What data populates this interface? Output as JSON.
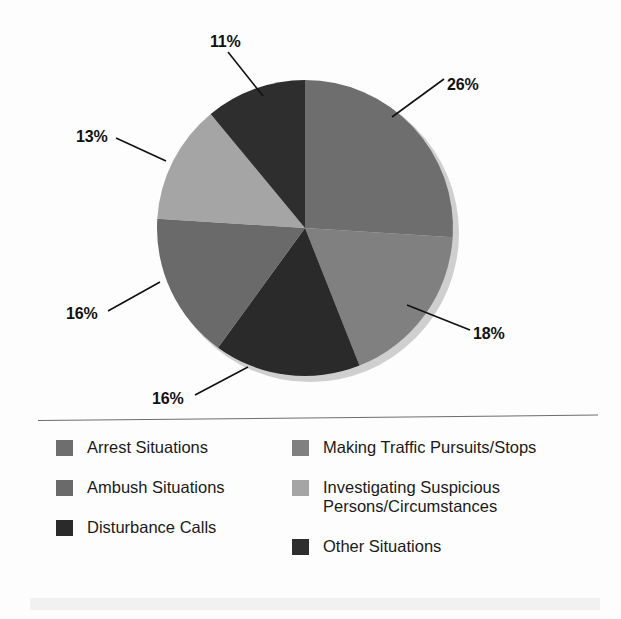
{
  "chart_data": {
    "type": "pie",
    "title": "",
    "subtitle": "",
    "xlabel": "",
    "ylabel": "",
    "grid": false,
    "legend_position": "bottom",
    "units": "percent",
    "start_angle_deg": 0,
    "direction": "clockwise",
    "categories": [
      "Arrest Situations",
      "Making Traffic Pursuits/Stops",
      "Disturbance Calls",
      "Ambush Situations",
      "Investigating Suspicious Persons/Circumstances",
      "Other Situations"
    ],
    "values": [
      26,
      18,
      16,
      16,
      13,
      11
    ],
    "data_labels": [
      "26%",
      "18%",
      "16%",
      "16%",
      "13%",
      "11%"
    ],
    "colors": [
      "#6e6e6e",
      "#808080",
      "#2a2a2a",
      "#6a6a6a",
      "#a5a5a5",
      "#2e2e2e"
    ],
    "slices": [
      {
        "label": "Arrest Situations",
        "value": 26,
        "data_label": "26%",
        "color": "#6e6e6e",
        "start_deg": 0,
        "end_deg": 93.6
      },
      {
        "label": "Making Traffic Pursuits/Stops",
        "value": 18,
        "data_label": "18%",
        "color": "#808080",
        "start_deg": 93.6,
        "end_deg": 158.4
      },
      {
        "label": "Disturbance Calls",
        "value": 16,
        "data_label": "16%",
        "color": "#2a2a2a",
        "start_deg": 158.4,
        "end_deg": 216.0
      },
      {
        "label": "Ambush Situations",
        "value": 16,
        "data_label": "16%",
        "color": "#6a6a6a",
        "start_deg": 216.0,
        "end_deg": 273.6
      },
      {
        "label": "Investigating Suspicious Persons/Circumstances",
        "value": 13,
        "data_label": "13%",
        "color": "#a5a5a5",
        "start_deg": 273.6,
        "end_deg": 320.4
      },
      {
        "label": "Other Situations",
        "value": 11,
        "data_label": "11%",
        "color": "#2e2e2e",
        "start_deg": 320.4,
        "end_deg": 360.0
      }
    ]
  },
  "callouts": [
    {
      "id": "pct-26",
      "text": "26%"
    },
    {
      "id": "pct-18",
      "text": "18%"
    },
    {
      "id": "pct-16-bottom",
      "text": "16%"
    },
    {
      "id": "pct-16-left",
      "text": "16%"
    },
    {
      "id": "pct-13",
      "text": "13%"
    },
    {
      "id": "pct-11",
      "text": "11%"
    }
  ],
  "legend": {
    "left_column": [
      {
        "label": "Arrest Situations",
        "color": "#6e6e6e"
      },
      {
        "label": "Ambush Situations",
        "color": "#6a6a6a"
      },
      {
        "label": "Disturbance Calls",
        "color": "#2a2a2a"
      }
    ],
    "right_column": [
      {
        "label": "Making Traffic Pursuits/Stops",
        "color": "#808080"
      },
      {
        "label": "Investigating Suspicious\nPersons/Circumstances",
        "color": "#a5a5a5"
      },
      {
        "label": "Other Situations",
        "color": "#2e2e2e"
      }
    ]
  },
  "theme": {
    "background": "#fdfdfd",
    "text": "#1a1a1a",
    "rule": "#6d6d6d",
    "shadow": "#cfcfcf",
    "band": "#f1f1f1"
  }
}
